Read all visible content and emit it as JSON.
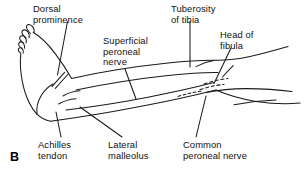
{
  "figure": {
    "panel_letter": "B",
    "background_color": "#ffffff",
    "ink_color": "#1a1a1a",
    "view": "lateral view of right lower limb, foot at left, knee at right",
    "labels": [
      {
        "id": "dorsal-prominence",
        "lines": [
          "Dorsal",
          "prominence"
        ]
      },
      {
        "id": "superficial-peroneal-nerve",
        "lines": [
          "Superficial",
          "peroneal",
          "nerve"
        ]
      },
      {
        "id": "tuberosity-of-tibia",
        "lines": [
          "Tuberosity",
          "of tibia"
        ]
      },
      {
        "id": "head-of-fibula",
        "lines": [
          "Head of",
          "fibula"
        ]
      },
      {
        "id": "achilles-tendon",
        "lines": [
          "Achilles",
          "tendon"
        ]
      },
      {
        "id": "lateral-malleolus",
        "lines": [
          "Lateral",
          "malleolus"
        ]
      },
      {
        "id": "common-peroneal-nerve",
        "lines": [
          "Common",
          "peroneal nerve"
        ]
      }
    ]
  },
  "text": {
    "dorsal_l1": "Dorsal",
    "dorsal_l2": "prominence",
    "superficial_l1": "Superficial",
    "superficial_l2": "peroneal",
    "superficial_l3": "nerve",
    "tuberosity_l1": "Tuberosity",
    "tuberosity_l2": "of tibia",
    "headfibula_l1": "Head of",
    "headfibula_l2": "fibula",
    "achilles_l1": "Achilles",
    "achilles_l2": "tendon",
    "lateral_l1": "Lateral",
    "lateral_l2": "malleolus",
    "common_l1": "Common",
    "common_l2": "peroneal nerve",
    "panel_b": "B"
  }
}
